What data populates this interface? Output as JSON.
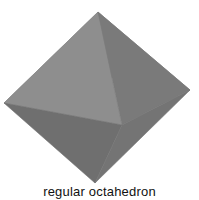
{
  "diagram": {
    "title": "regular octahedron",
    "vertices": {
      "top": [
        98,
        12
      ],
      "left": [
        4,
        103
      ],
      "right": [
        190,
        90
      ],
      "bottom": [
        95,
        183
      ],
      "front": [
        122,
        125
      ],
      "back": [
        72,
        71
      ]
    },
    "faces": [
      {
        "name": "upper-left-back",
        "points": "top left back",
        "color": "#7d7d7d"
      },
      {
        "name": "upper-right-back",
        "points": "top back right",
        "color": "#838383"
      },
      {
        "name": "upper-left-front",
        "points": "top left front",
        "color": "#8e8e8e"
      },
      {
        "name": "upper-right-front",
        "points": "top front right",
        "color": "#7a7a7a"
      },
      {
        "name": "lower-left-front",
        "points": "left front bottom",
        "color": "#6f6f6f"
      },
      {
        "name": "lower-right-front",
        "points": "front right bottom",
        "color": "#747474"
      }
    ],
    "caption": "regular octahedron"
  }
}
